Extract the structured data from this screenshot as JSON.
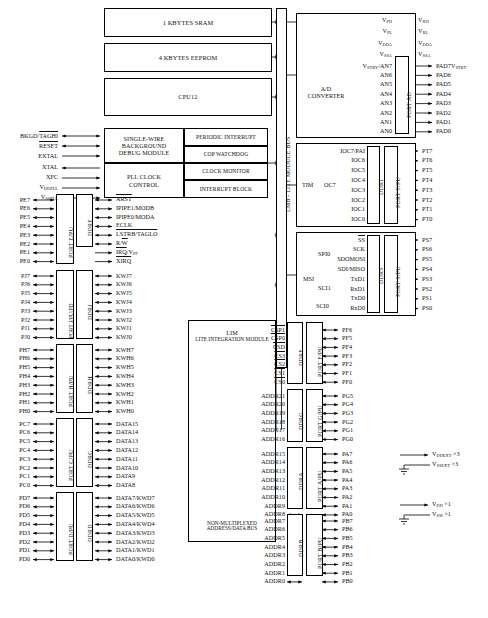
{
  "diagram": {
    "bus_label": "LMB - LITE MODULE BUS"
  },
  "memory_blocks": [
    {
      "label": "1 KBYTES SRAM"
    },
    {
      "label": "4 KBYTES EEPROM"
    },
    {
      "label": "CPU12"
    }
  ],
  "debug_block": {
    "line1": "SINGLE-WIRE",
    "line2": "BACKGROUND",
    "line3": "DEBUG MODULE"
  },
  "pll_block": {
    "line1": "PLL CLOCK",
    "line2": "CONTROL"
  },
  "system_blocks": [
    {
      "label": "PERIODIC INTERRUPT"
    },
    {
      "label": "COP WATCHDOG"
    },
    {
      "label": "CLOCK MONITOR"
    },
    {
      "label": "INTERRUPT BLOCK"
    }
  ],
  "debug_pins": [
    {
      "name": "BKGD/TAGHI",
      "overline": "partial",
      "dir": "bidir"
    },
    {
      "name": "RESET",
      "overline": "full",
      "dir": "bidir"
    },
    {
      "name": "EXTAL",
      "overline": "none",
      "dir": "in"
    }
  ],
  "pll_pins": [
    {
      "name": "XTAL",
      "overline": "none",
      "dir": "out"
    },
    {
      "name": "XFC",
      "overline": "none",
      "dir": "in"
    },
    {
      "name": "VDDPLL",
      "base": "V",
      "sub": "DDPLL",
      "dir": "in"
    },
    {
      "name": "VSSPLL",
      "base": "V",
      "sub": "SSPLL",
      "dir": "in"
    }
  ],
  "adc": {
    "title_line1": "A/D",
    "title_line2": "CONVERTER",
    "ref_pins": [
      {
        "inner_base": "V",
        "inner_sub": "RH",
        "outer_base": "V",
        "outer_sub": "RH",
        "inner_label": "V_PH"
      },
      {
        "inner_base": "V",
        "inner_sub": "PL",
        "outer_base": "V",
        "outer_sub": "RL"
      },
      {
        "inner_base": "V",
        "inner_sub": "DDA",
        "outer_base": "V",
        "outer_sub": "DDA"
      },
      {
        "inner_base": "V",
        "inner_sub": "SSA",
        "outer_base": "V",
        "outer_sub": "SSA"
      }
    ],
    "ref_inner": [
      "V_PH",
      "V_PL",
      "V_DDA",
      "V_SSA"
    ],
    "ref_outer": [
      "V_RH",
      "V_RL",
      "V_DDA",
      "V_SSA"
    ],
    "channels": [
      {
        "inner": "VSTBY/AN7",
        "outer": "PAD7VSTBY"
      },
      {
        "inner": "AN6",
        "outer": "PAD6"
      },
      {
        "inner": "AN5",
        "outer": "PAD5"
      },
      {
        "inner": "AN4",
        "outer": "PAD4"
      },
      {
        "inner": "AN3",
        "outer": "PAD3"
      },
      {
        "inner": "AN2",
        "outer": "PAD2"
      },
      {
        "inner": "AN1",
        "outer": "PAD1"
      },
      {
        "inner": "AN0",
        "outer": "PAD0"
      }
    ],
    "port_label": "PORT AD"
  },
  "tim": {
    "title": "TIM",
    "subtitle": "OC7",
    "signals": [
      "IOC7/PAI",
      "IOC6",
      "IOC5",
      "IOC4",
      "IOC3",
      "IOC2",
      "IOC1",
      "IOC0"
    ],
    "pins": [
      "PT7",
      "PT6",
      "PT5",
      "PT4",
      "PT3",
      "PT2",
      "PT1",
      "PT0"
    ],
    "ddr_label": "DDRT",
    "port_label": "PORT T/PU"
  },
  "serial": {
    "spi_label": "SPI0",
    "msi_label": "MSI",
    "sci1_label": "SCI1",
    "sci0_label": "SCI0",
    "signals": [
      {
        "name": "SS",
        "overline": "full",
        "dir": "bidir"
      },
      {
        "name": "SCK",
        "overline": "none",
        "dir": "bidir"
      },
      {
        "name": "SDOMOSI",
        "overline": "none",
        "dir": "bidir"
      },
      {
        "name": "SDI/MISO",
        "overline": "none",
        "dir": "bidir"
      },
      {
        "name": "TxD1",
        "overline": "none",
        "dir": "out"
      },
      {
        "name": "RxD1",
        "overline": "none",
        "dir": "in"
      },
      {
        "name": "TxD0",
        "overline": "none",
        "dir": "out"
      },
      {
        "name": "RxD0",
        "overline": "none",
        "dir": "in"
      }
    ],
    "pins": [
      "PS7",
      "PS6",
      "PS5",
      "PS4",
      "PS3",
      "PS2",
      "PS1",
      "PS0"
    ],
    "ddr_label": "DDRS",
    "port_label": "PORT S/PU"
  },
  "lim": {
    "title_line1": "LIM",
    "title_line2": "LITE INTEGRATION MODULE",
    "note_line1": "NON-MULTIPLEXED",
    "note_line2": "ADDRESS/DATA BUS"
  },
  "port_f": {
    "signals": [
      {
        "name": "CSP1",
        "overline": "full"
      },
      {
        "name": "CSP0",
        "overline": "full"
      },
      {
        "name": "CSD",
        "overline": "full"
      },
      {
        "name": "CS3",
        "overline": "full"
      },
      {
        "name": "CS2",
        "overline": "full"
      },
      {
        "name": "CS1",
        "overline": "full"
      },
      {
        "name": "CS0",
        "overline": "full"
      }
    ],
    "pins": [
      "PF6",
      "PF5",
      "PF4",
      "PF3",
      "PF2",
      "PF1",
      "PF0"
    ],
    "ddr_label": "DDRF",
    "port_label": "PORT F/PU"
  },
  "port_g": {
    "signals": [
      "ADDR21",
      "ADDR20",
      "ADDR19",
      "ADDR18",
      "ADDR17",
      "ADDR16"
    ],
    "pins": [
      "PG5",
      "PG4",
      "PG3",
      "PG2",
      "PG1",
      "PG0"
    ],
    "ddr_label": "DDRG",
    "port_label": "PORT G/PU"
  },
  "port_a": {
    "signals": [
      "ADDR15",
      "ADDR14",
      "ADDR13",
      "ADDR12",
      "ADDR11",
      "ADDR10",
      "ADDR9",
      "ADDR8"
    ],
    "pins": [
      "PA7",
      "PA6",
      "PA5",
      "PA4",
      "PA3",
      "PA2",
      "PA1",
      "PA0"
    ],
    "ddr_label": "DDRA",
    "port_label": "PORT A/PU"
  },
  "port_b": {
    "signals": [
      "ADDR7",
      "ADDR6",
      "ADDR5",
      "ADDR4",
      "ADDR3",
      "ADDR2",
      "ADDR1",
      "ADDR0"
    ],
    "pins": [
      "PB7",
      "PB6",
      "PB5",
      "PB4",
      "PB3",
      "PB2",
      "PB1",
      "PB0"
    ],
    "ddr_label": "DDRB",
    "port_label": "PORT B/PU"
  },
  "port_e": {
    "pins": [
      "PE7",
      "PE6",
      "PE5",
      "PE4",
      "PE3",
      "PE2",
      "PE1",
      "PE0"
    ],
    "signals": [
      {
        "name": "ARST",
        "overline": "full",
        "dir": "bidir"
      },
      {
        "name": "IPIPE1/MODB",
        "overline": "none",
        "dir": "bidir"
      },
      {
        "name": "IPIPE0/MODA",
        "overline": "none",
        "dir": "bidir"
      },
      {
        "name": "ECLK",
        "overline": "none",
        "dir": "bidir"
      },
      {
        "name": "LSTRB/TAGLO",
        "overline": "full",
        "dir": "bidir"
      },
      {
        "name": "R/W",
        "overline": "partial",
        "dir": "bidir"
      },
      {
        "name": "IRQ/VPP",
        "overline": "partial",
        "dir": "in"
      },
      {
        "name": "XIRQ",
        "overline": "full",
        "dir": "in"
      }
    ],
    "ddr_label": "DDRE",
    "port_label": "PORT E/PU"
  },
  "port_j": {
    "pins": [
      "PJ7",
      "PJ6",
      "PJ5",
      "PJ4",
      "PJ3",
      "PJ2",
      "PJ1",
      "PJ0"
    ],
    "signals": [
      "KWJ7",
      "KWJ6",
      "KWJ5",
      "KWJ4",
      "KWJ3",
      "KWJ2",
      "KWJ1",
      "KWJ0"
    ],
    "ddr_label": "DDRJ",
    "port_label": "PORT J/PU/PD"
  },
  "port_h": {
    "pins": [
      "PH7",
      "PH6",
      "PH5",
      "PH4",
      "PH3",
      "PH2",
      "PH1",
      "PH0"
    ],
    "signals": [
      "KWH7",
      "KWH6",
      "KWH5",
      "KWH4",
      "KWH3",
      "KWH2",
      "KWH1",
      "KWH0"
    ],
    "ddr_label": "DDRH",
    "port_label": "PORT H/PU"
  },
  "port_c": {
    "pins": [
      "PC7",
      "PC6",
      "PC5",
      "PC4",
      "PC3",
      "PC2",
      "PC1",
      "PC0"
    ],
    "signals": [
      "DATA15",
      "DATA14",
      "DATA13",
      "DATA12",
      "DATA11",
      "DATA10",
      "DATA9",
      "DATA8"
    ],
    "ddr_label": "DDRC",
    "port_label": "PORT C/PU"
  },
  "port_d": {
    "pins": [
      "PD7",
      "PD6",
      "PD5",
      "PD4",
      "PD3",
      "PD2",
      "PD1",
      "PD0"
    ],
    "signals": [
      "DATA7/KWD7",
      "DATA6/KWD6",
      "DATA5/KWD5",
      "DATA4/KWD4",
      "DATA3/KWD3",
      "DATA2/KWD2",
      "DATA1/KWD1",
      "DATA0/KWD0"
    ],
    "ddr_label": "DDRD",
    "port_label": "PORT D/PU"
  },
  "power": [
    {
      "supply_base": "V",
      "supply_sub": "DDEXT",
      "mult": "×3",
      "gnd_base": "V",
      "gnd_sub": "SSEXT",
      "gnd_mult": "×3"
    },
    {
      "supply_base": "V",
      "supply_sub": "DD",
      "mult": "×1",
      "gnd_base": "V",
      "gnd_sub": "SSI",
      "gnd_mult": "×1"
    }
  ]
}
